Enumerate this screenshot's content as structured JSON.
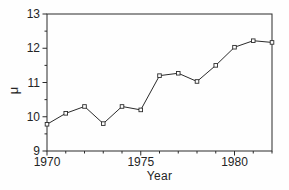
{
  "figure": {
    "background": "#fefefe",
    "ink_color": "#2b2b2b",
    "text_color": "#242424"
  },
  "chart_data": {
    "type": "line",
    "title": "",
    "xlabel": "Year",
    "ylabel": "μ",
    "x": [
      1970,
      1971,
      1972,
      1973,
      1974,
      1975,
      1976,
      1977,
      1978,
      1979,
      1980,
      1981,
      1982
    ],
    "values": [
      9.78,
      10.1,
      10.3,
      9.8,
      10.3,
      10.2,
      11.2,
      11.27,
      11.03,
      11.5,
      12.03,
      12.22,
      12.17
    ],
    "xlim": [
      1970,
      1982
    ],
    "ylim": [
      9,
      13
    ],
    "x_major_ticks": [
      1970,
      1975,
      1980
    ],
    "x_major_tick_labels": [
      "1970",
      "1975",
      "1980"
    ],
    "x_minor_step": 1,
    "y_major_ticks": [
      9,
      10,
      11,
      12,
      13
    ],
    "y_major_tick_labels": [
      "9",
      "10",
      "11",
      "12",
      "13"
    ],
    "y_minor_step": 0.5,
    "marker": "open-square",
    "marker_size": 3.6,
    "line_color": "#2b2b2b",
    "line_width": 1,
    "grid": false,
    "legend": null,
    "plot_box": {
      "left": 47,
      "top": 14,
      "right": 272,
      "bottom": 151
    }
  }
}
